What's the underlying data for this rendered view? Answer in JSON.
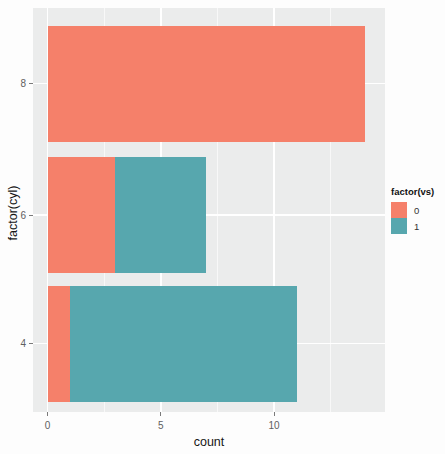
{
  "chart_data": {
    "type": "bar",
    "orientation": "horizontal",
    "stacked": true,
    "title": "",
    "xlabel": "count",
    "ylabel": "factor(cyl)",
    "categories": [
      "8",
      "6",
      "4"
    ],
    "series": [
      {
        "name": "0",
        "color": "#F5806A",
        "values": [
          14,
          3,
          1
        ]
      },
      {
        "name": "1",
        "color": "#57A7AE",
        "values": [
          0,
          4,
          10
        ]
      }
    ],
    "x_ticks": [
      0,
      5,
      10
    ],
    "x_tick_labels": [
      "0",
      "5",
      "10"
    ],
    "x_minor_ticks": [
      2.5,
      7.5,
      12.5
    ],
    "xlim": [
      -0.65,
      14.9
    ],
    "grid": true,
    "legend_position": "right",
    "panel_background": "#EBECEC",
    "grid_color": "#FFFFFF"
  },
  "axes": {
    "x_title": "count",
    "y_title": "factor(cyl)",
    "x_tick_labels": [
      "0",
      "5",
      "10"
    ],
    "y_tick_labels": [
      "8",
      "6",
      "4"
    ]
  },
  "legend": {
    "title": "factor(vs)",
    "items": [
      {
        "label": "0",
        "color": "#F5806A"
      },
      {
        "label": "1",
        "color": "#57A7AE"
      }
    ]
  }
}
